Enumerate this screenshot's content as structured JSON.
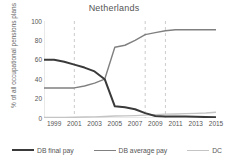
{
  "chart_data": {
    "type": "line",
    "title": "Netherlands",
    "xlabel": "",
    "ylabel": "% of all occupational pensions plans",
    "xlim": [
      1998,
      2015
    ],
    "ylim": [
      0,
      100
    ],
    "grid": false,
    "legend_position": "bottom",
    "x": [
      1998,
      1999,
      2000,
      2001,
      2002,
      2003,
      2004,
      2005,
      2006,
      2007,
      2008,
      2009,
      2010,
      2011,
      2012,
      2013,
      2014,
      2015
    ],
    "series": [
      {
        "name": "DB final pay",
        "color": "#3a3a3a",
        "values": [
          60,
          60,
          58,
          55,
          52,
          48,
          40,
          12,
          11,
          9,
          5,
          2,
          1.5,
          1.5,
          1.5,
          1.2,
          1,
          0.8
        ]
      },
      {
        "name": "DB average pay",
        "color": "#808080",
        "values": [
          31,
          31,
          31,
          31,
          33,
          36,
          40,
          73,
          75,
          80,
          86,
          88,
          90,
          91,
          91,
          91,
          91,
          91
        ]
      },
      {
        "name": "DC",
        "color": "#c4c4c4",
        "values": [
          0.5,
          0.5,
          0.6,
          0.8,
          1,
          1.2,
          1.5,
          2,
          2.2,
          2.5,
          3,
          3.5,
          4,
          4.2,
          4.5,
          4.8,
          5.2,
          6
        ]
      }
    ],
    "vertical_markers": [
      2001,
      2008,
      2010
    ],
    "vertical_marker_color": "#cccccc",
    "yticks": [
      0,
      20,
      40,
      60,
      80,
      100
    ],
    "xticks": [
      1999,
      2001,
      2003,
      2005,
      2007,
      2009,
      2011,
      2013,
      2015
    ]
  },
  "legend": {
    "items": [
      {
        "label": "DB final pay"
      },
      {
        "label": "DB average pay"
      },
      {
        "label": "DC"
      }
    ]
  }
}
